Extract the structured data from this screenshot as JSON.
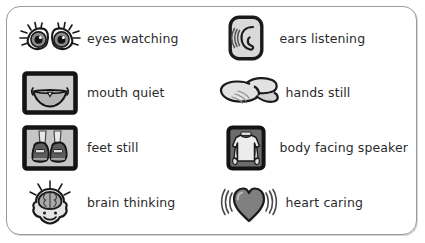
{
  "poster": {
    "title": "Whole Body Listening",
    "border_color": "#9a9a9a",
    "background_color": "#ffffff",
    "text_color": "#2b2b2b",
    "icon_fill_light": "#d9d9d9",
    "icon_fill_mid": "#9e9e9e",
    "icon_fill_dark": "#6f6f6f",
    "icon_outline": "#1a1a1a",
    "items": [
      {
        "id": "eyes-watching",
        "label": "eyes watching",
        "icon": "eyes-icon",
        "column": 1,
        "row": 1
      },
      {
        "id": "ears-listening",
        "label": "ears listening",
        "icon": "ear-icon",
        "column": 2,
        "row": 1
      },
      {
        "id": "mouth-quiet",
        "label": "mouth quiet",
        "icon": "mouth-icon",
        "column": 1,
        "row": 2
      },
      {
        "id": "hands-still",
        "label": "hands still",
        "icon": "hands-icon",
        "column": 2,
        "row": 2
      },
      {
        "id": "feet-still",
        "label": "feet still",
        "icon": "feet-icon",
        "column": 1,
        "row": 3
      },
      {
        "id": "body-facing-speaker",
        "label": "body facing speaker",
        "icon": "body-icon",
        "column": 2,
        "row": 3
      },
      {
        "id": "brain-thinking",
        "label": "brain thinking",
        "icon": "brain-icon",
        "column": 1,
        "row": 4
      },
      {
        "id": "heart-caring",
        "label": "heart caring",
        "icon": "heart-icon",
        "column": 2,
        "row": 4
      }
    ]
  }
}
